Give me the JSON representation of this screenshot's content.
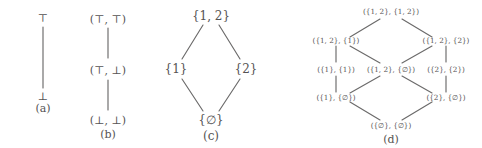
{
  "figure": {
    "ink_color": "#555353",
    "edge_color": "#6b6a6a",
    "background": "#ffffff"
  },
  "panels": [
    {
      "id": "a",
      "caption": "(a)",
      "nodes": [
        {
          "id": "a-top",
          "label": "⊤"
        },
        {
          "id": "a-bot",
          "label": "⊥"
        }
      ],
      "edges": [
        {
          "from": "a-top",
          "to": "a-bot"
        }
      ]
    },
    {
      "id": "b",
      "caption": "(b)",
      "nodes": [
        {
          "id": "b-tt",
          "label": "(⊤, ⊤)"
        },
        {
          "id": "b-tb",
          "label": "(⊤, ⊥)"
        },
        {
          "id": "b-bb",
          "label": "(⊥, ⊥)"
        }
      ],
      "edges": [
        {
          "from": "b-tt",
          "to": "b-tb"
        },
        {
          "from": "b-tb",
          "to": "b-bb"
        }
      ]
    },
    {
      "id": "c",
      "caption": "(c)",
      "nodes": [
        {
          "id": "c-12",
          "label": "{1, 2}"
        },
        {
          "id": "c-1",
          "label": "{1}"
        },
        {
          "id": "c-2",
          "label": "{2}"
        },
        {
          "id": "c-e",
          "label": "{∅}"
        }
      ],
      "edges": [
        {
          "from": "c-12",
          "to": "c-1"
        },
        {
          "from": "c-12",
          "to": "c-2"
        },
        {
          "from": "c-1",
          "to": "c-e"
        },
        {
          "from": "c-2",
          "to": "c-e"
        }
      ]
    },
    {
      "id": "d",
      "caption": "(d)",
      "nodes": [
        {
          "id": "d-top",
          "label": "({1, 2}, {1, 2})"
        },
        {
          "id": "d-l1",
          "label": "({1, 2}, {1})"
        },
        {
          "id": "d-r1",
          "label": "({1, 2}, {2})"
        },
        {
          "id": "d-l2",
          "label": "({1}, {1})"
        },
        {
          "id": "d-c2",
          "label": "({1, 2}, {∅})"
        },
        {
          "id": "d-r2",
          "label": "({2}, {2})"
        },
        {
          "id": "d-l3",
          "label": "({1}, {∅})"
        },
        {
          "id": "d-r3",
          "label": "({2}, {∅})"
        },
        {
          "id": "d-bot",
          "label": "({∅}, {∅})"
        }
      ],
      "edges": [
        {
          "from": "d-top",
          "to": "d-l1"
        },
        {
          "from": "d-top",
          "to": "d-r1"
        },
        {
          "from": "d-l1",
          "to": "d-l2"
        },
        {
          "from": "d-l1",
          "to": "d-c2"
        },
        {
          "from": "d-r1",
          "to": "d-c2"
        },
        {
          "from": "d-r1",
          "to": "d-r2"
        },
        {
          "from": "d-l2",
          "to": "d-l3"
        },
        {
          "from": "d-c2",
          "to": "d-l3"
        },
        {
          "from": "d-c2",
          "to": "d-r3"
        },
        {
          "from": "d-r2",
          "to": "d-r3"
        },
        {
          "from": "d-l3",
          "to": "d-bot"
        },
        {
          "from": "d-r3",
          "to": "d-bot"
        }
      ]
    }
  ]
}
